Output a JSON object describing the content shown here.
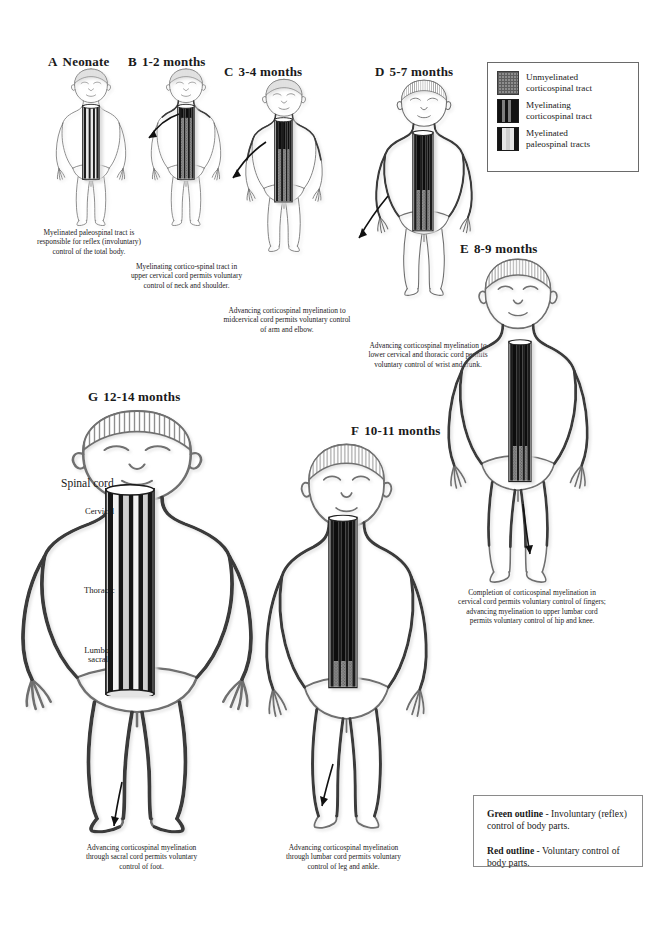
{
  "figure": {
    "colors": {
      "unmyelinated": "#6e6e6e",
      "myelinating": "#141414",
      "myelinated_paleospinal": "#d8d8d8",
      "outline": "#707070",
      "outline_dark": "#3a3a3a",
      "text": "#1a1a1a",
      "legend_border": "#6a6a6a"
    }
  },
  "legend_top": {
    "items": [
      {
        "swatch": "unmyelinated-corticospinal-swatch",
        "line1": "Unmyelinated",
        "line2": "corticospinal tract"
      },
      {
        "swatch": "myelinating-corticospinal-swatch",
        "line1": "Myelinating",
        "line2": "corticospinal tract"
      },
      {
        "swatch": "myelinated-paleospinal-swatch",
        "line1": "Myelinated",
        "line2": "paleospinal tracts"
      }
    ]
  },
  "legend_bottom": {
    "green_term": "Green outline",
    "green_text": " - Involuntary (reflex) control of body parts.",
    "red_term": "Red outline",
    "red_text": " - Voluntary control of body parts."
  },
  "cord_annotations": {
    "spinal_cord": "Spinal cord",
    "cervical": "Cervical",
    "thoracic": "Thoracic",
    "lumbosacral": "Lumbo-\nsacral",
    "lumbo": "Lumbo-",
    "sacral": "sacral"
  },
  "panels": [
    {
      "id": "A",
      "letter": "A",
      "age": "Neonate",
      "caption": "Myelinated paleospinal tract is responsible for reflex (involuntary) control of the total body."
    },
    {
      "id": "B",
      "letter": "B",
      "age": "1-2 months",
      "caption": "Myelinating cortico-spinal tract in upper cervical cord permits voluntary control of neck and shoulder."
    },
    {
      "id": "C",
      "letter": "C",
      "age": "3-4 months",
      "caption": "Advancing corticospinal myelination to midcervical cord permits voluntary control of arm and elbow."
    },
    {
      "id": "D",
      "letter": "D",
      "age": "5-7 months",
      "caption": "Advancing corticospinal myelination to lower cervical and thoracic cord permits voluntary control of wrist and trunk."
    },
    {
      "id": "E",
      "letter": "E",
      "age": "8-9 months",
      "caption": "Completion of corticospinal myelination in cervical cord permits voluntary control of fingers; advancing myelination to upper lumbar cord permits voluntary control of hip and knee."
    },
    {
      "id": "F",
      "letter": "F",
      "age": "10-11 months",
      "caption": "Advancing corticospinal myelination through lumbar cord permits voluntary control of leg and ankle."
    },
    {
      "id": "G",
      "letter": "G",
      "age": "12-14 months",
      "caption": "Advancing corticospinal myelination through sacral cord permits voluntary control of foot."
    }
  ]
}
